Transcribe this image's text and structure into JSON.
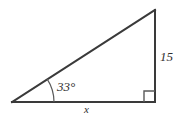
{
  "figure": {
    "type": "right-triangle",
    "background_color": "#ffffff",
    "stroke_color": "#3a3a3a",
    "label_color": "#2f2f2f",
    "stroke_width": 2,
    "vertices": {
      "left": {
        "x": 12,
        "y": 102
      },
      "bottom_right": {
        "x": 155,
        "y": 102
      },
      "top_right": {
        "x": 155,
        "y": 10
      }
    },
    "angle_arc": {
      "center_x": 12,
      "center_y": 102,
      "radius": 42,
      "start_angle_deg": 0,
      "end_angle_deg": 33
    },
    "right_angle_marker": {
      "corner_x": 155,
      "corner_y": 102,
      "size": 11
    },
    "labels": {
      "angle": "33°",
      "vertical_side": "15",
      "base_side": "x"
    }
  }
}
